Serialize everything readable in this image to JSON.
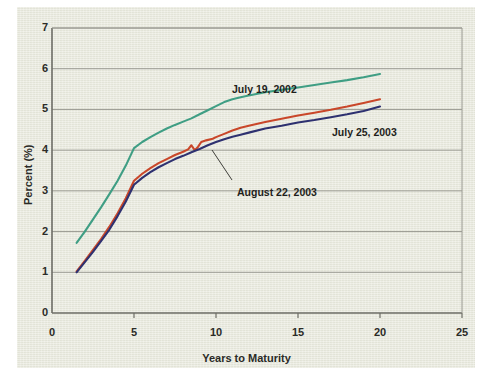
{
  "figure": {
    "background_color": "#ffffff",
    "panel_color": "#e8e9dd",
    "axis_color": "#6d6d66",
    "grid_color": "#9a9a92"
  },
  "chart_data": {
    "type": "line",
    "title": "",
    "xlabel": "Years to Maturity",
    "ylabel": "Percent (%)",
    "xlim": [
      0,
      25
    ],
    "ylim": [
      0,
      7
    ],
    "xticks": [
      0,
      5,
      10,
      15,
      20,
      25
    ],
    "yticks": [
      0,
      1,
      2,
      3,
      4,
      5,
      6,
      7
    ],
    "xtick_labels": [
      "0",
      "5",
      "10",
      "15",
      "20",
      "25"
    ],
    "ytick_labels": [
      "0",
      "1",
      "2",
      "3",
      "4",
      "5",
      "6",
      "7"
    ],
    "grid": "horizontal",
    "legend_position": "inline-annotations",
    "series": [
      {
        "name": "July 19, 2002",
        "color": "#3f9e84",
        "x": [
          1.5,
          2,
          2.5,
          3,
          3.5,
          4,
          4.5,
          5,
          5.5,
          6,
          6.5,
          7,
          7.5,
          8,
          8.5,
          9,
          9.5,
          10,
          10.5,
          11,
          11.5,
          12,
          13,
          14,
          15,
          16,
          17,
          18,
          19,
          20
        ],
        "y": [
          1.72,
          2.0,
          2.3,
          2.6,
          2.92,
          3.25,
          3.62,
          4.05,
          4.2,
          4.32,
          4.43,
          4.53,
          4.62,
          4.7,
          4.78,
          4.88,
          4.98,
          5.08,
          5.18,
          5.25,
          5.3,
          5.34,
          5.42,
          5.48,
          5.54,
          5.6,
          5.66,
          5.72,
          5.79,
          5.87
        ]
      },
      {
        "name": "July 25, 2003",
        "color": "#c9472a",
        "x": [
          1.5,
          2,
          2.5,
          3,
          3.5,
          4,
          4.5,
          5,
          5.5,
          6,
          6.5,
          7,
          7.5,
          8,
          8.3,
          8.5,
          8.7,
          8.9,
          9.1,
          9.4,
          9.8,
          10,
          10.5,
          11,
          11.5,
          12,
          13,
          14,
          15,
          16,
          17,
          18,
          19,
          20
        ],
        "y": [
          1.02,
          1.28,
          1.55,
          1.82,
          2.12,
          2.45,
          2.82,
          3.25,
          3.42,
          3.56,
          3.68,
          3.78,
          3.88,
          3.96,
          4.02,
          4.12,
          4.0,
          4.08,
          4.2,
          4.24,
          4.28,
          4.32,
          4.4,
          4.48,
          4.55,
          4.6,
          4.69,
          4.77,
          4.85,
          4.92,
          4.99,
          5.07,
          5.16,
          5.25
        ]
      },
      {
        "name": "August 22, 2003",
        "color": "#2e3170",
        "x": [
          1.5,
          2,
          2.5,
          3,
          3.5,
          4,
          4.5,
          5,
          5.5,
          6,
          6.5,
          7,
          7.5,
          8,
          8.5,
          9,
          9.5,
          10,
          10.5,
          11,
          11.5,
          12,
          13,
          14,
          15,
          16,
          17,
          18,
          19,
          20
        ],
        "y": [
          1.0,
          1.25,
          1.5,
          1.77,
          2.05,
          2.38,
          2.74,
          3.15,
          3.32,
          3.46,
          3.58,
          3.68,
          3.78,
          3.86,
          3.95,
          4.03,
          4.12,
          4.2,
          4.27,
          4.33,
          4.38,
          4.43,
          4.53,
          4.6,
          4.68,
          4.74,
          4.81,
          4.88,
          4.96,
          5.07
        ]
      }
    ],
    "annotations": [
      {
        "text": "July 19, 2002",
        "label_x": 232,
        "label_y": 83,
        "leader": false
      },
      {
        "text": "July 25, 2003",
        "label_x": 332,
        "label_y": 126,
        "leader": false
      },
      {
        "text": "August 22, 2003",
        "label_x": 237,
        "label_y": 186,
        "leader": true,
        "leader_from": [
          232,
          180
        ],
        "leader_to": [
          212,
          150
        ]
      }
    ]
  }
}
